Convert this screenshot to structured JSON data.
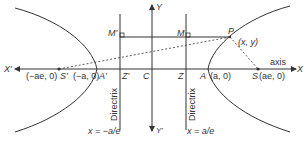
{
  "diagram": {
    "type": "hyperbola",
    "axes": {
      "x_pos": "X",
      "x_neg": "X'",
      "y_pos": "Y",
      "y_neg": "Y'",
      "axis_label": "axis"
    },
    "points": {
      "center": "C",
      "vertex_right": "A",
      "vertex_right_coord": "(a, 0)",
      "vertex_left": "A'",
      "vertex_left_coord": "(−a, 0)",
      "focus_right": "S",
      "focus_right_coord": "(ae, 0)",
      "focus_left": "S'",
      "focus_left_coord": "(−ae, 0)",
      "foot_right": "Z",
      "foot_left": "Z'",
      "perp_right": "M",
      "perp_left": "M'",
      "point": "P",
      "point_coord": "(x, y)"
    },
    "directrices": {
      "left_label": "Directrix",
      "left_equation": "x = −a/e",
      "right_label": "Directrix",
      "right_equation": "x = a/e"
    },
    "colors": {
      "line": "#333333",
      "background": "#ffffff"
    }
  }
}
